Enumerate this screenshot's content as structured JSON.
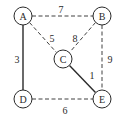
{
  "diagram": {
    "type": "weighted-graph",
    "nodes": [
      {
        "id": "A",
        "label": "A",
        "x": 23,
        "y": 16
      },
      {
        "id": "B",
        "label": "B",
        "x": 102,
        "y": 16
      },
      {
        "id": "C",
        "label": "C",
        "x": 63,
        "y": 59
      },
      {
        "id": "D",
        "label": "D",
        "x": 23,
        "y": 99
      },
      {
        "id": "E",
        "label": "E",
        "x": 102,
        "y": 99
      }
    ],
    "edges": [
      {
        "from": "A",
        "to": "B",
        "weight": "7",
        "style": "dashed"
      },
      {
        "from": "A",
        "to": "C",
        "weight": "5",
        "style": "dashed"
      },
      {
        "from": "A",
        "to": "D",
        "weight": "3",
        "style": "solid"
      },
      {
        "from": "B",
        "to": "C",
        "weight": "8",
        "style": "dashed"
      },
      {
        "from": "B",
        "to": "E",
        "weight": "9",
        "style": "dashed"
      },
      {
        "from": "C",
        "to": "E",
        "weight": "1",
        "style": "solid"
      },
      {
        "from": "D",
        "to": "E",
        "weight": "6",
        "style": "dashed"
      }
    ],
    "colors": {
      "stroke": "#2a2a2a",
      "background": "#ffffff"
    }
  }
}
